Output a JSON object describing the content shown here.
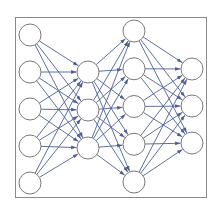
{
  "diagram": {
    "type": "feedforward-neural-network",
    "layers": [
      {
        "name": "layer-1",
        "node_count": 5
      },
      {
        "name": "layer-2",
        "node_count": 3
      },
      {
        "name": "layer-3",
        "node_count": 5
      },
      {
        "name": "layer-4",
        "node_count": 3
      }
    ],
    "connectivity": "fully-connected",
    "edge_direction": "left-to-right",
    "colors": {
      "node_stroke": "#7a7a7a",
      "node_fill": "#ffffff",
      "edge": "#4d6096",
      "frame": "#8a8a8a"
    }
  }
}
